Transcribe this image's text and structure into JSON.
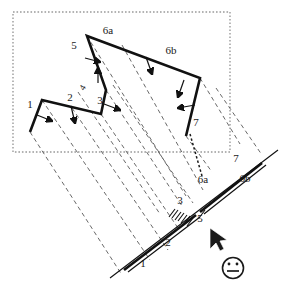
{
  "diagram": {
    "frame": {
      "style": "dotted",
      "color": "#9a9a9a"
    },
    "colors": {
      "outline": "#111111",
      "dashed_ray": "#4d4d4d",
      "frame": "#9a9a9a",
      "label": "#1a1a1a",
      "cursor": "#1a1a1a"
    },
    "plan_labels": [
      {
        "id": "p1",
        "text": "1",
        "x": 30,
        "y": 108
      },
      {
        "id": "p2",
        "text": "2",
        "x": 70,
        "y": 101
      },
      {
        "id": "p3",
        "text": "3",
        "x": 100,
        "y": 104
      },
      {
        "id": "p4",
        "text": "4",
        "x": 85,
        "y": 89
      },
      {
        "id": "p5",
        "text": "5",
        "x": 74,
        "y": 49
      },
      {
        "id": "p6a",
        "text": "6a",
        "x": 108,
        "y": 34
      },
      {
        "id": "p6b",
        "text": "6b",
        "x": 171,
        "y": 54
      },
      {
        "id": "p7",
        "text": "7",
        "x": 196,
        "y": 126
      }
    ],
    "projection_labels": [
      {
        "id": "j1",
        "text": "1",
        "x": 143,
        "y": 267
      },
      {
        "id": "j2",
        "text": "2",
        "x": 168,
        "y": 246
      },
      {
        "id": "j3",
        "text": "3",
        "x": 180,
        "y": 204
      },
      {
        "id": "j5",
        "text": "5",
        "x": 200,
        "y": 220
      },
      {
        "id": "j6a",
        "text": "6a",
        "x": 203,
        "y": 183
      },
      {
        "id": "j6b",
        "text": "6b",
        "x": 245,
        "y": 182
      },
      {
        "id": "j7",
        "text": "7",
        "x": 236,
        "y": 162
      }
    ],
    "cursor": {
      "name": "mouse-pointer",
      "x": 212,
      "y": 230
    },
    "emoji": {
      "name": "neutral-face",
      "x": 233,
      "y": 268,
      "r": 11
    }
  }
}
